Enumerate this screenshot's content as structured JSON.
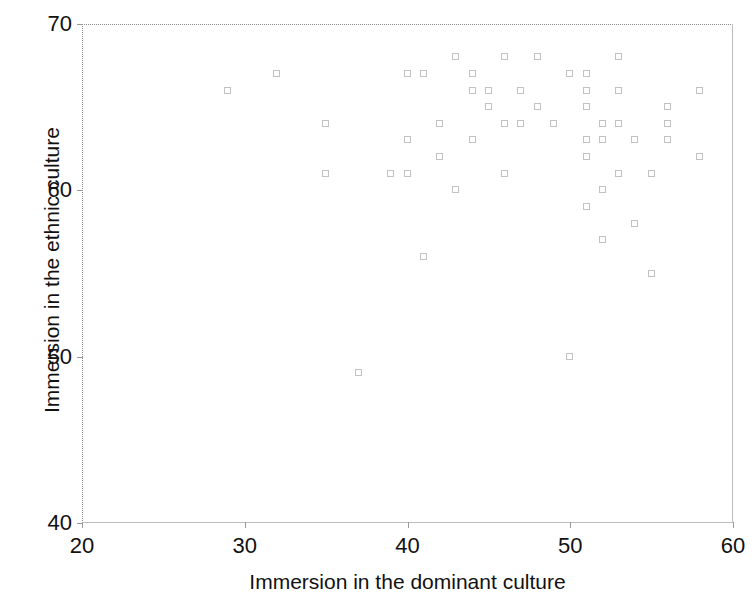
{
  "chart_data": {
    "type": "scatter",
    "title": "",
    "xlabel": "Immersion in the dominant culture",
    "ylabel": "Immersion in the ethnic culture",
    "xlim": [
      20,
      60
    ],
    "ylim": [
      40,
      70
    ],
    "xticks": [
      20,
      30,
      40,
      50,
      60
    ],
    "yticks": [
      40,
      50,
      60,
      70
    ],
    "grid": false,
    "legend": null,
    "marker": "open-square",
    "marker_color": "#c2c2c2",
    "points": [
      {
        "x": 29,
        "y": 66
      },
      {
        "x": 32,
        "y": 67
      },
      {
        "x": 35,
        "y": 64
      },
      {
        "x": 35,
        "y": 61
      },
      {
        "x": 37,
        "y": 49
      },
      {
        "x": 39,
        "y": 61
      },
      {
        "x": 40,
        "y": 67
      },
      {
        "x": 40,
        "y": 63
      },
      {
        "x": 40,
        "y": 61
      },
      {
        "x": 41,
        "y": 67
      },
      {
        "x": 41,
        "y": 56
      },
      {
        "x": 42,
        "y": 64
      },
      {
        "x": 42,
        "y": 62
      },
      {
        "x": 43,
        "y": 68
      },
      {
        "x": 43,
        "y": 60
      },
      {
        "x": 44,
        "y": 67
      },
      {
        "x": 44,
        "y": 66
      },
      {
        "x": 44,
        "y": 63
      },
      {
        "x": 45,
        "y": 66
      },
      {
        "x": 45,
        "y": 65
      },
      {
        "x": 46,
        "y": 68
      },
      {
        "x": 46,
        "y": 64
      },
      {
        "x": 46,
        "y": 61
      },
      {
        "x": 47,
        "y": 66
      },
      {
        "x": 47,
        "y": 64
      },
      {
        "x": 48,
        "y": 68
      },
      {
        "x": 48,
        "y": 65
      },
      {
        "x": 49,
        "y": 64
      },
      {
        "x": 50,
        "y": 67
      },
      {
        "x": 50,
        "y": 50
      },
      {
        "x": 51,
        "y": 67
      },
      {
        "x": 51,
        "y": 66
      },
      {
        "x": 51,
        "y": 65
      },
      {
        "x": 51,
        "y": 63
      },
      {
        "x": 51,
        "y": 62
      },
      {
        "x": 51,
        "y": 59
      },
      {
        "x": 52,
        "y": 64
      },
      {
        "x": 52,
        "y": 63
      },
      {
        "x": 52,
        "y": 60
      },
      {
        "x": 52,
        "y": 57
      },
      {
        "x": 53,
        "y": 68
      },
      {
        "x": 53,
        "y": 66
      },
      {
        "x": 53,
        "y": 64
      },
      {
        "x": 53,
        "y": 61
      },
      {
        "x": 54,
        "y": 63
      },
      {
        "x": 54,
        "y": 58
      },
      {
        "x": 55,
        "y": 61
      },
      {
        "x": 55,
        "y": 55
      },
      {
        "x": 56,
        "y": 65
      },
      {
        "x": 56,
        "y": 64
      },
      {
        "x": 56,
        "y": 63
      },
      {
        "x": 58,
        "y": 66
      },
      {
        "x": 58,
        "y": 62
      }
    ]
  },
  "caption": {
    "text": ""
  }
}
